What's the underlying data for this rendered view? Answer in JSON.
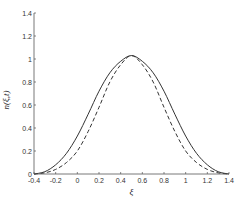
{
  "chart_data": {
    "type": "line",
    "title": "",
    "xlabel": "ξ",
    "ylabel": "n(ξ,t)",
    "xlim": [
      -0.4,
      1.4
    ],
    "ylim": [
      0,
      1.4
    ],
    "xticks": [
      -0.4,
      -0.2,
      0,
      0.2,
      0.4,
      0.6,
      0.8,
      1,
      1.2,
      1.4
    ],
    "xtick_labels": [
      "-0.4",
      "-0.2",
      "0",
      "0.2",
      "0.4",
      "0.6",
      "0.8",
      "1",
      "1.2",
      "1.4"
    ],
    "yticks": [
      0,
      0.2,
      0.4,
      0.6,
      0.8,
      1,
      1.2,
      1.4
    ],
    "ytick_labels": [
      "0",
      "0.2",
      "0.4",
      "0.6",
      "0.8",
      "1",
      "1.2",
      "1.4"
    ],
    "grid": false,
    "legend": null,
    "x": [
      -0.4,
      -0.3,
      -0.2,
      -0.1,
      0,
      0.1,
      0.2,
      0.3,
      0.4,
      0.5,
      0.6,
      0.7,
      0.8,
      0.9,
      1.0,
      1.1,
      1.2,
      1.3,
      1.4
    ],
    "series": [
      {
        "name": "solid",
        "style": "solid",
        "color": "#333333",
        "values": [
          0,
          0.02,
          0.08,
          0.18,
          0.33,
          0.52,
          0.72,
          0.88,
          0.98,
          1.03,
          0.98,
          0.88,
          0.72,
          0.52,
          0.33,
          0.18,
          0.08,
          0.02,
          0
        ]
      },
      {
        "name": "dashed",
        "style": "dashed",
        "color": "#333333",
        "values": [
          0,
          0.01,
          0.04,
          0.1,
          0.2,
          0.37,
          0.58,
          0.8,
          0.95,
          1.03,
          0.95,
          0.8,
          0.58,
          0.37,
          0.2,
          0.1,
          0.04,
          0.01,
          0
        ]
      }
    ]
  }
}
